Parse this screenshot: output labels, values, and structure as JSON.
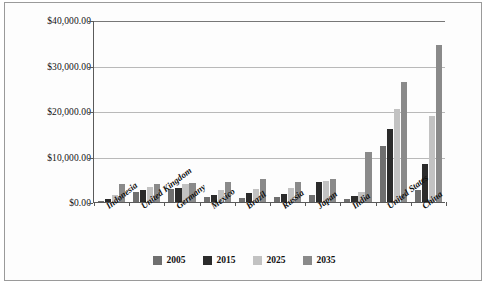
{
  "chart_data": {
    "type": "bar",
    "title": "",
    "subtitle": "",
    "xlabel": "",
    "ylabel": "",
    "ylim": [
      0,
      40000
    ],
    "grid": true,
    "legend_position": "bottom",
    "categories": [
      "Indonesia",
      "United Kingdom",
      "Germany",
      "Mexico",
      "Brazil",
      "Russia",
      "Japan",
      "India",
      "United States",
      "China"
    ],
    "ytick_labels": [
      "$0.00",
      "$10,000.00",
      "$20,000.00",
      "$30,000.00",
      "$40,000.00"
    ],
    "ytick_values": [
      0,
      10000,
      20000,
      30000,
      40000
    ],
    "series": [
      {
        "name": "2005",
        "color": "#6f6f6f",
        "values": [
          300,
          2200,
          2900,
          1200,
          900,
          1100,
          1600,
          700,
          12400,
          2700
        ]
      },
      {
        "name": "2015",
        "color": "#2b2b2b",
        "values": [
          700,
          2600,
          3100,
          1500,
          1900,
          1800,
          4500,
          1300,
          16100,
          8400
        ]
      },
      {
        "name": "2025",
        "color": "#c2c2c2",
        "values": [
          1600,
          3400,
          3900,
          2700,
          2900,
          3100,
          4700,
          2200,
          20500,
          18900
        ]
      },
      {
        "name": "2035",
        "color": "#8a8a8a",
        "values": [
          4000,
          4000,
          4200,
          4300,
          5100,
          4300,
          5100,
          11000,
          26300,
          34500
        ]
      }
    ]
  },
  "legend": {
    "items": [
      {
        "label": "2005",
        "color": "#6f6f6f"
      },
      {
        "label": "2015",
        "color": "#2b2b2b"
      },
      {
        "label": "2025",
        "color": "#c2c2c2"
      },
      {
        "label": "2035",
        "color": "#8a8a8a"
      }
    ]
  }
}
